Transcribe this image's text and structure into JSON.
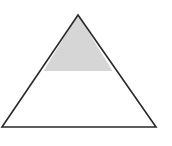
{
  "diagram": {
    "shape": "triangle",
    "apex": [
      78,
      15
    ],
    "base_left": [
      2,
      127
    ],
    "base_right": [
      156,
      127
    ],
    "shaded_region": "top portion above horizontal cut",
    "cut_y": 71,
    "colors": {
      "stroke": "#2a2a2a",
      "fill_shaded": "#d6d6d6",
      "background": "#ffffff"
    }
  }
}
